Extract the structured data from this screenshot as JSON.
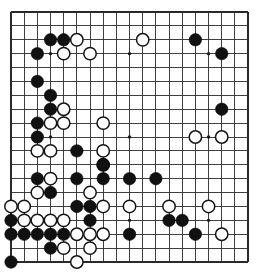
{
  "app": {
    "title": "Go Board Diagram",
    "board_label": "go-board"
  },
  "board": {
    "size": 19,
    "origin_x": 11,
    "origin_y": 12,
    "spacing_x": 13.17,
    "spacing_y": 13.89,
    "stone_radius": 6.2,
    "line_color": "#2a2a2a",
    "background_color": "#ffffff",
    "black_color": "#111111",
    "white_color": "#ffffff",
    "white_border_color": "#151515",
    "star_points": [
      [
        3,
        3
      ],
      [
        9,
        3
      ],
      [
        15,
        3
      ],
      [
        3,
        9
      ],
      [
        9,
        9
      ],
      [
        15,
        9
      ],
      [
        3,
        15
      ],
      [
        9,
        15
      ],
      [
        15,
        15
      ]
    ],
    "black_stones": [
      [
        3,
        2
      ],
      [
        4,
        2
      ],
      [
        14,
        2
      ],
      [
        2,
        3
      ],
      [
        16,
        3
      ],
      [
        2,
        5
      ],
      [
        3,
        6
      ],
      [
        3,
        7
      ],
      [
        16,
        7
      ],
      [
        2,
        8
      ],
      [
        2,
        9
      ],
      [
        5,
        10
      ],
      [
        7,
        11
      ],
      [
        2,
        12
      ],
      [
        5,
        12
      ],
      [
        7,
        12
      ],
      [
        9,
        12
      ],
      [
        11,
        12
      ],
      [
        3,
        13
      ],
      [
        5,
        14
      ],
      [
        6,
        14
      ],
      [
        0,
        15
      ],
      [
        6,
        15
      ],
      [
        12,
        15
      ],
      [
        13,
        15
      ],
      [
        0,
        16
      ],
      [
        1,
        16
      ],
      [
        2,
        16
      ],
      [
        3,
        16
      ],
      [
        4,
        16
      ],
      [
        9,
        16
      ],
      [
        14,
        16
      ],
      [
        3,
        17
      ],
      [
        0,
        18
      ]
    ],
    "white_stones": [
      [
        5,
        2
      ],
      [
        10,
        2
      ],
      [
        4,
        3
      ],
      [
        6,
        3
      ],
      [
        4,
        7
      ],
      [
        3,
        8
      ],
      [
        4,
        8
      ],
      [
        7,
        8
      ],
      [
        14,
        9
      ],
      [
        16,
        9
      ],
      [
        2,
        10
      ],
      [
        3,
        10
      ],
      [
        7,
        10
      ],
      [
        7,
        11
      ],
      [
        3,
        12
      ],
      [
        2,
        13
      ],
      [
        6,
        13
      ],
      [
        0,
        14
      ],
      [
        1,
        14
      ],
      [
        7,
        14
      ],
      [
        9,
        14
      ],
      [
        12,
        14
      ],
      [
        15,
        14
      ],
      [
        1,
        15
      ],
      [
        2,
        15
      ],
      [
        3,
        15
      ],
      [
        4,
        15
      ],
      [
        5,
        16
      ],
      [
        6,
        16
      ],
      [
        7,
        16
      ],
      [
        16,
        16
      ],
      [
        4,
        17
      ],
      [
        6,
        17
      ],
      [
        5,
        18
      ]
    ]
  }
}
